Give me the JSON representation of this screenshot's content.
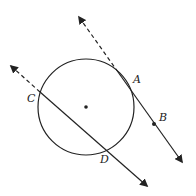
{
  "diagram": {
    "type": "geometry",
    "colors": {
      "stroke": "#222222",
      "background": "#ffffff"
    },
    "circle": {
      "cx": 86,
      "cy": 107,
      "r": 48,
      "center_marked": true
    },
    "points": [
      {
        "label": "A",
        "x": 129,
        "y": 86,
        "marked": false,
        "label_x": 133,
        "label_y": 83
      },
      {
        "label": "B",
        "x": 154,
        "y": 124,
        "marked": true,
        "label_x": 159,
        "label_y": 121
      },
      {
        "label": "C",
        "x": 40,
        "y": 92,
        "marked": false,
        "label_x": 27,
        "label_y": 102
      },
      {
        "label": "D",
        "x": 105,
        "y": 149,
        "marked": false,
        "label_x": 100,
        "label_y": 163
      }
    ],
    "lines": [
      {
        "name": "tangent-AB",
        "through": [
          "A",
          "B"
        ],
        "dashed_segment": [
          [
            79,
            17
          ],
          [
            118,
            72
          ]
        ],
        "solid_segment": [
          [
            118,
            72
          ],
          [
            182,
            162
          ]
        ],
        "arrows": "both"
      },
      {
        "name": "secant-CD",
        "through": [
          "C",
          "D"
        ],
        "dashed_segment": [
          [
            11,
            66
          ],
          [
            40,
            92
          ]
        ],
        "solid_segment": [
          [
            40,
            92
          ],
          [
            147,
            186
          ]
        ],
        "arrows": "both"
      }
    ]
  }
}
